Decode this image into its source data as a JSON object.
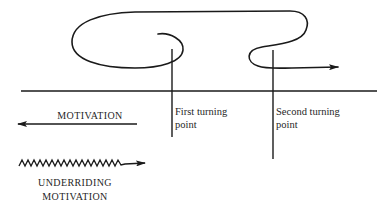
{
  "diagram": {
    "type": "story-structure",
    "turning_points": [
      {
        "line1": "First turning",
        "line2": "point"
      },
      {
        "line1": "Second turning",
        "line2": "point"
      }
    ],
    "legend": {
      "motivation": "MOTIVATION",
      "underriding_line1": "UNDERRIDING",
      "underriding_line2": "MOTIVATION"
    },
    "colors": {
      "stroke": "#1a1a1a",
      "background": "#ffffff"
    }
  }
}
